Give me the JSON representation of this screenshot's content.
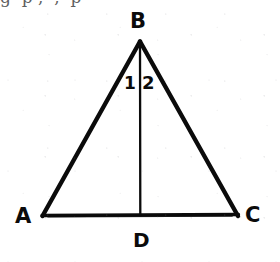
{
  "figure": {
    "name": "isosceles-triangle-with-altitude",
    "background_color": "#ffffff",
    "ink_color": "#0b0b0b",
    "width": 280,
    "height": 262
  },
  "labels": {
    "apex": "B",
    "bottom_left": "A",
    "bottom_right": "C",
    "foot": "D",
    "angle_left": "1",
    "angle_right": "2"
  },
  "top_text_remnant": {
    "text": "g  p ,  ,  p"
  },
  "geometry": {
    "points": {
      "A": {
        "x": 42,
        "y": 216
      },
      "B": {
        "x": 140,
        "y": 41
      },
      "C": {
        "x": 238,
        "y": 216
      },
      "D": {
        "x": 140,
        "y": 215
      }
    },
    "segments": [
      {
        "name": "side-AB",
        "from": "A",
        "to": "B",
        "stroke_width": 4.4
      },
      {
        "name": "side-BC",
        "from": "B",
        "to": "C",
        "stroke_width": 4.4
      },
      {
        "name": "base-AC",
        "from": "A",
        "to": "C",
        "stroke_width": 3.2
      },
      {
        "name": "cevian-BD",
        "from": "B",
        "to": "D",
        "stroke_width": 2.2
      }
    ]
  }
}
